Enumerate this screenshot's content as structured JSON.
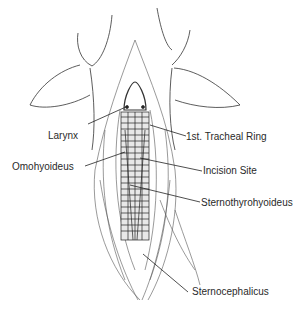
{
  "diagram": {
    "labels": [
      {
        "id": "larynx",
        "text": "Larynx",
        "x": 48,
        "y": 136
      },
      {
        "id": "tracheal-ring",
        "text": "1st. Tracheal Ring",
        "x": 186,
        "y": 129
      },
      {
        "id": "omohyoideus",
        "text": "Omohyoideus",
        "x": 12,
        "y": 161
      },
      {
        "id": "incision-site",
        "text": "Incision Site",
        "x": 203,
        "y": 164
      },
      {
        "id": "sternothyrohyoideus",
        "text": "Sternothyrohyoideus",
        "x": 201,
        "y": 197
      },
      {
        "id": "sternocephalicus",
        "text": "Sternocephalicus",
        "x": 192,
        "y": 287
      }
    ]
  }
}
